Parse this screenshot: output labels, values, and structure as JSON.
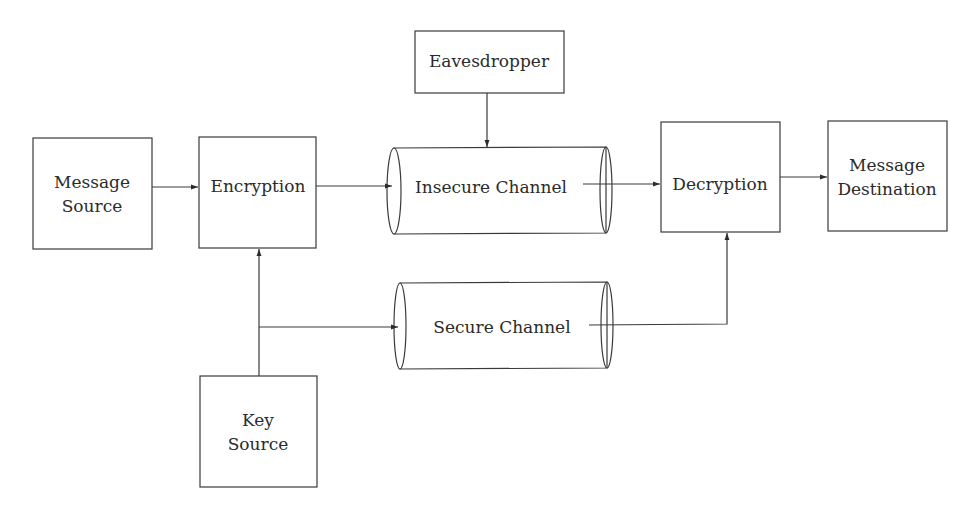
{
  "diagram": {
    "colors": {
      "stroke": "#3a3a3a",
      "text": "#2b2b2b",
      "background": "#ffffff"
    },
    "nodes": {
      "message_source": {
        "line1": "Message",
        "line2": "Source"
      },
      "encryption": {
        "label": "Encryption"
      },
      "eavesdropper": {
        "label": "Eavesdropper"
      },
      "insecure_channel": {
        "label": "Insecure Channel"
      },
      "secure_channel": {
        "label": "Secure Channel"
      },
      "decryption": {
        "label": "Decryption"
      },
      "message_destination": {
        "line1": "Message",
        "line2": "Destination"
      },
      "key_source": {
        "line1": "Key",
        "line2": "Source"
      }
    },
    "edges": [
      {
        "from": "Message Source",
        "to": "Encryption"
      },
      {
        "from": "Encryption",
        "to": "Insecure Channel"
      },
      {
        "from": "Eavesdropper",
        "to": "Insecure Channel"
      },
      {
        "from": "Insecure Channel",
        "to": "Decryption"
      },
      {
        "from": "Decryption",
        "to": "Message Destination"
      },
      {
        "from": "Key Source",
        "to": "Encryption"
      },
      {
        "from": "Key Source",
        "to": "Secure Channel"
      },
      {
        "from": "Secure Channel",
        "to": "Decryption"
      }
    ]
  }
}
